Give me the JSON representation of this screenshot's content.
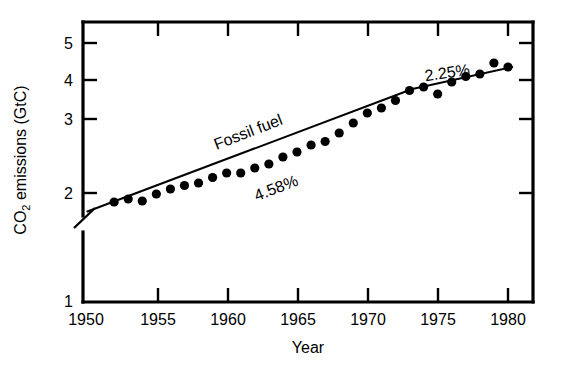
{
  "chart_data": {
    "type": "scatter",
    "title": "",
    "xlabel": "Year",
    "ylabel": "CO2 emissions (GtC)",
    "ylabel_parts": {
      "pre": "CO",
      "sub": "2",
      "post": " emissions (GtC)"
    },
    "xlim": [
      1950,
      1981
    ],
    "ylim": [
      1,
      5.55
    ],
    "y_axis_break": {
      "between": [
        1,
        2
      ],
      "note": "axis broken below 2"
    },
    "grid": false,
    "legend": null,
    "xticks": [
      1950,
      1955,
      1960,
      1965,
      1970,
      1975,
      1980
    ],
    "xtick_labels": [
      "1950",
      "1955",
      "1960",
      "1965",
      "1970",
      "1975",
      "1980"
    ],
    "yticks": [
      1,
      2,
      3,
      4,
      5
    ],
    "ytick_labels": [
      "1",
      "2",
      "3",
      "4",
      "5"
    ],
    "series": [
      {
        "name": "Fossil fuel",
        "marker": "filled-circle",
        "color": "#000000",
        "x": [
          1952,
          1953,
          1954,
          1955,
          1956,
          1957,
          1958,
          1959,
          1960,
          1961,
          1962,
          1963,
          1964,
          1965,
          1966,
          1967,
          1968,
          1969,
          1970,
          1971,
          1972,
          1973,
          1974,
          1975,
          1976,
          1977,
          1978,
          1979,
          1980
        ],
        "y": [
          1.82,
          1.88,
          1.84,
          1.98,
          2.08,
          2.15,
          2.2,
          2.31,
          2.4,
          2.4,
          2.5,
          2.58,
          2.72,
          2.82,
          2.96,
          3.03,
          3.2,
          3.4,
          3.6,
          3.7,
          3.85,
          4.05,
          4.12,
          3.98,
          4.22,
          4.33,
          4.38,
          4.6,
          4.52
        ]
      }
    ],
    "trend_lines": [
      {
        "label": "4.58%",
        "rate_percent": 4.58,
        "x_start": 1950.1,
        "y_start": 1.63,
        "x_end": 1973.2,
        "y_end": 4.08
      },
      {
        "label": "2.25%",
        "rate_percent": 2.25,
        "x_start": 1973.2,
        "y_start": 4.08,
        "x_end": 1980.3,
        "y_end": 4.52
      }
    ],
    "annotations": [
      {
        "text": "Fossil fuel",
        "x": 1961.5,
        "y": 3.0,
        "rotation": -21
      },
      {
        "text": "4.58%",
        "x": 1963.5,
        "y": 2.28,
        "rotation": -21
      },
      {
        "text": "2.25%",
        "x": 1975.2,
        "y": 4.06,
        "rotation": -8
      }
    ]
  },
  "axis": {
    "x_title": "Year",
    "y_title_pre": "CO",
    "y_title_sub": "2",
    "y_title_post": " emissions (GtC)"
  },
  "colors": {
    "foreground": "#000000",
    "background": "#ffffff"
  }
}
